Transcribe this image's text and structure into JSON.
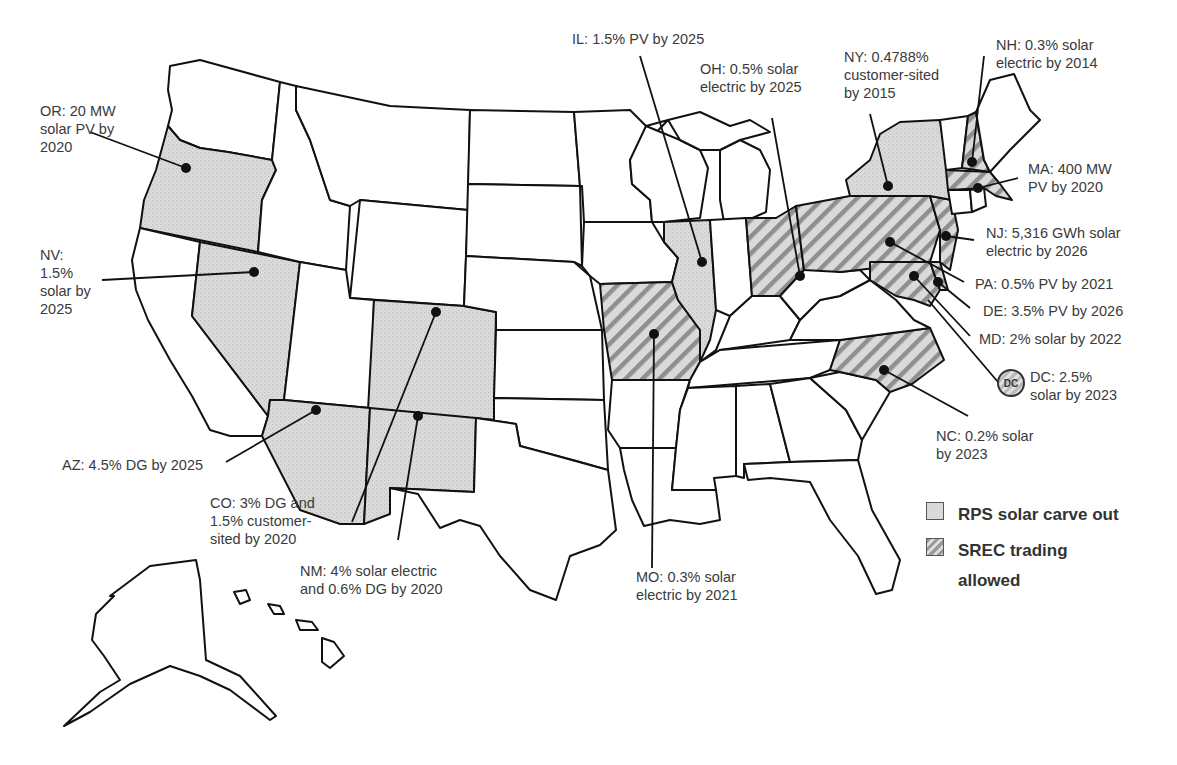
{
  "map": {
    "title": "State solar carve-outs and SREC trading",
    "colors": {
      "outline": "#111111",
      "rps_fill": "#d9d9d9",
      "srec_hatch_dark": "#8f8f8f",
      "srec_hatch_light": "#dcdcdc",
      "label_text": "#3a3a3a"
    }
  },
  "legend": {
    "items": [
      {
        "key": "rps",
        "label": "RPS solar carve out"
      },
      {
        "key": "srec",
        "label": "SREC trading allowed"
      }
    ]
  },
  "states": [
    {
      "code": "OR",
      "category": "rps",
      "label": "OR: 20 MW\nsolar PV by\n2020"
    },
    {
      "code": "NV",
      "category": "rps",
      "label": "NV:\n1.5%\nsolar by\n2025"
    },
    {
      "code": "AZ",
      "category": "rps",
      "label": "AZ: 4.5% DG by 2025"
    },
    {
      "code": "CO",
      "category": "rps",
      "label": "CO: 3% DG and\n1.5% customer-\nsited by 2020"
    },
    {
      "code": "NM",
      "category": "rps",
      "label": "NM: 4% solar electric\nand 0.6% DG by 2020"
    },
    {
      "code": "IL",
      "category": "rps",
      "label": "IL: 1.5% PV by 2025"
    },
    {
      "code": "MO",
      "category": "srec",
      "label": "MO: 0.3% solar\nelectric by 2021"
    },
    {
      "code": "OH",
      "category": "srec",
      "label": "OH: 0.5% solar\nelectric by 2025"
    },
    {
      "code": "NY",
      "category": "rps",
      "label": "NY:  0.4788%\ncustomer-sited\nby 2015"
    },
    {
      "code": "NH",
      "category": "srec",
      "label": "NH: 0.3% solar\nelectric by 2014"
    },
    {
      "code": "MA",
      "category": "srec",
      "label": "MA: 400 MW\nPV by 2020"
    },
    {
      "code": "NJ",
      "category": "srec",
      "label": "NJ: 5,316 GWh solar\nelectric by 2026"
    },
    {
      "code": "PA",
      "category": "srec",
      "label": "PA: 0.5% PV by 2021"
    },
    {
      "code": "DE",
      "category": "srec",
      "label": "DE: 3.5% PV by 2026"
    },
    {
      "code": "MD",
      "category": "srec",
      "label": "MD: 2% solar by 2022"
    },
    {
      "code": "DC",
      "category": "srec",
      "label": "DC: 2.5%\nsolar by 2023",
      "badge": "DC"
    },
    {
      "code": "NC",
      "category": "srec",
      "label": "NC: 0.2% solar\nby 2023"
    }
  ]
}
